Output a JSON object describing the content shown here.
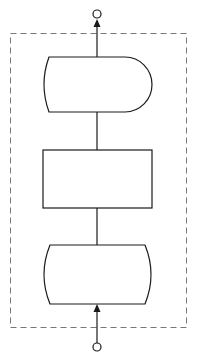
{
  "diagram": {
    "title": "",
    "colors": {
      "stroke": "#1a1a1a",
      "dashed_border": "#777777",
      "fill": "#ffffff",
      "background": "#ffffff"
    },
    "container": {
      "style": "dashed",
      "x": 10,
      "y": 33,
      "width": 176,
      "height": 294
    },
    "nodes": [
      {
        "id": "output-shape",
        "shape": "delay",
        "label": "",
        "x": 43,
        "y": 57,
        "width": 109,
        "height": 55
      },
      {
        "id": "process-box",
        "shape": "rectangle",
        "label": "",
        "x": 43,
        "y": 150,
        "width": 109,
        "height": 58
      },
      {
        "id": "input-shape",
        "shape": "stored-data-double-curve",
        "label": "",
        "x": 43,
        "y": 245,
        "width": 109,
        "height": 59
      }
    ],
    "ports": [
      {
        "id": "output-port",
        "cx": 97,
        "cy": 14,
        "r": 4
      },
      {
        "id": "input-port",
        "cx": 97,
        "cy": 347,
        "r": 4
      }
    ],
    "edges": [
      {
        "from": "output-shape",
        "to": "output-port",
        "arrow": "up"
      },
      {
        "from": "process-box",
        "to": "output-shape",
        "arrow": "none"
      },
      {
        "from": "input-shape",
        "to": "process-box",
        "arrow": "none"
      },
      {
        "from": "input-port",
        "to": "input-shape",
        "arrow": "up"
      }
    ]
  }
}
